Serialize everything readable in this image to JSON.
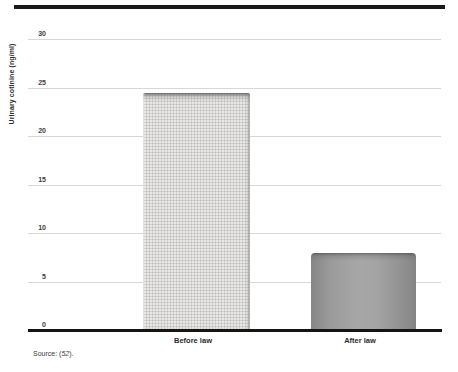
{
  "chart_data": {
    "type": "bar",
    "categories": [
      "Before law",
      "After law"
    ],
    "values": [
      24.4,
      7.9
    ],
    "title": "",
    "xlabel": "",
    "ylabel": "Urinary cotinine (ng/ml)",
    "ylim": [
      0,
      30
    ],
    "yticks": [
      0,
      5,
      10,
      15,
      20,
      25,
      30
    ],
    "grid": "horizontal",
    "legend": "none",
    "gridline_color": "#d7d7d7",
    "axis_color": "#141414",
    "bar_colors": [
      "#e9e8e6",
      "#9a9a9a"
    ],
    "bar_textures": [
      "fine-grid-paper",
      "smooth-metallic-gradient"
    ]
  },
  "figure": {
    "source_prefix": "Source: (",
    "source_ref": "52",
    "source_suffix": ")."
  }
}
